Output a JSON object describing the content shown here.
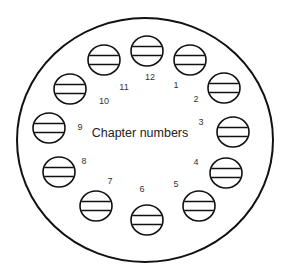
{
  "diagram": {
    "title": "Chapter numbers",
    "outer": {
      "cx": 145,
      "cy": 140,
      "rx": 128,
      "ry": 122,
      "stroke": "#111111",
      "stroke_width": 2
    },
    "seats": [
      {
        "label": "1",
        "cx": 190,
        "cy": 60,
        "lx": 176,
        "ly": 85
      },
      {
        "label": "2",
        "cx": 224,
        "cy": 88,
        "lx": 196,
        "ly": 99
      },
      {
        "label": "3",
        "cx": 233,
        "cy": 132,
        "lx": 201,
        "ly": 122
      },
      {
        "label": "4",
        "cx": 226,
        "cy": 173,
        "lx": 196,
        "ly": 162
      },
      {
        "label": "5",
        "cx": 199,
        "cy": 206,
        "lx": 176,
        "ly": 184
      },
      {
        "label": "6",
        "cx": 147,
        "cy": 220,
        "lx": 142,
        "ly": 189
      },
      {
        "label": "7",
        "cx": 96,
        "cy": 206,
        "lx": 110,
        "ly": 181
      },
      {
        "label": "8",
        "cx": 59,
        "cy": 172,
        "lx": 84,
        "ly": 161
      },
      {
        "label": "9",
        "cx": 49,
        "cy": 128,
        "lx": 80,
        "ly": 127
      },
      {
        "label": "10",
        "cx": 70,
        "cy": 89,
        "lx": 104,
        "ly": 101
      },
      {
        "label": "11",
        "cx": 104,
        "cy": 60,
        "lx": 124,
        "ly": 87
      },
      {
        "label": "12",
        "cx": 147,
        "cy": 51,
        "lx": 150,
        "ly": 77
      }
    ],
    "seat_rx": 16,
    "seat_ry": 15
  }
}
